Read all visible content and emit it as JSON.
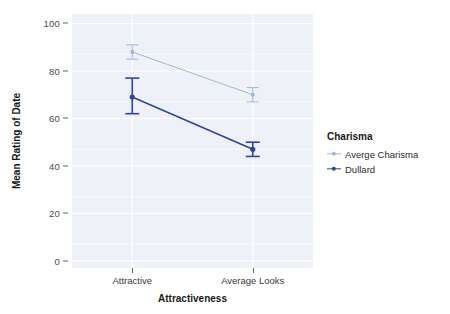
{
  "chart_data": {
    "type": "line",
    "title": "",
    "xlabel": "Attractiveness",
    "ylabel": "Mean Rating of Date",
    "categories": [
      "Attractive",
      "Average Looks"
    ],
    "x_tick_labels": [
      "Attractive",
      "Average Looks"
    ],
    "y_tick_labels": [
      "0",
      "20",
      "40",
      "60",
      "80",
      "100"
    ],
    "y_ticks": [
      0,
      20,
      40,
      60,
      80,
      100
    ],
    "ylim": [
      -3,
      104
    ],
    "grid": true,
    "legend_position": "right",
    "legend_title": "Charisma",
    "series": [
      {
        "name": "Averge Charisma",
        "color": "#9fb6dd",
        "values": [
          88,
          70
        ],
        "error_low": [
          85,
          67
        ],
        "error_high": [
          91,
          73
        ]
      },
      {
        "name": "Dullard",
        "color": "#2b45a8",
        "values": [
          69,
          47
        ],
        "error_low": [
          62,
          44
        ],
        "error_high": [
          77,
          50
        ]
      }
    ],
    "panel_background": "#eef2f8",
    "gridline_color": "#ffffff"
  },
  "axes": {
    "y_title": "Mean Rating of Date",
    "x_title": "Attractiveness"
  },
  "legend": {
    "title": "Charisma",
    "items": [
      {
        "label": "Averge Charisma",
        "color": "#9fb6dd"
      },
      {
        "label": "Dullard",
        "color": "#2b45a8"
      }
    ]
  }
}
